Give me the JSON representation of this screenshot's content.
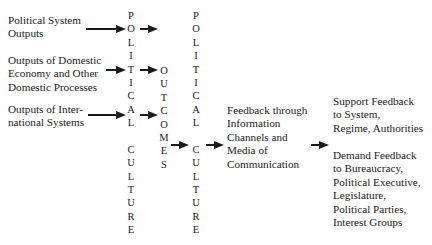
{
  "diagram": {
    "inputs": [
      {
        "label": "Political System\nOutputs"
      },
      {
        "label": "Outputs of Domestic\nEconomy and Other\nDomestic Processes"
      },
      {
        "label": "Outputs of Inter-\nnational Systems"
      }
    ],
    "column_political_culture_1": {
      "letters": [
        "P",
        "O",
        "L",
        "I",
        "T",
        "I",
        "C",
        "A",
        "L",
        "",
        "C",
        "U",
        "L",
        "T",
        "U",
        "R",
        "E"
      ]
    },
    "column_outcomes": {
      "letters": [
        "O",
        "U",
        "T",
        "C",
        "O",
        "M",
        "E",
        "S"
      ]
    },
    "column_political_culture_2": {
      "letters": [
        "P",
        "O",
        "L",
        "I",
        "T",
        "I",
        "C",
        "A",
        "L",
        "",
        "C",
        "U",
        "L",
        "T",
        "U",
        "R",
        "E"
      ]
    },
    "feedback_channel": {
      "label": "Feedback through\nInformation\nChannels and\nMedia of\nCommunication"
    },
    "outputs": [
      {
        "label": "Support Feedback\nto System,\nRegime, Authorities"
      },
      {
        "label": "Demand Feedback\nto Bureaucracy,\nPolitical Executive,\nLegislature,\nPolitical Parties,\nInterest Groups"
      }
    ],
    "arrow_color": "#1a1a1a"
  }
}
